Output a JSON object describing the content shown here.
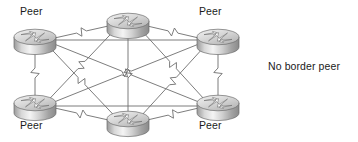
{
  "diagram": {
    "background_color": "#ffffff",
    "link_color": "#6e6e6e",
    "label_color": "#1b1b1b",
    "icon": {
      "name": "cisco-router-icon",
      "body_light": "#f2f2f2",
      "body_mid": "#c9c9c9",
      "body_dark": "#8e8e8e",
      "top_light": "#ececec",
      "top_dark": "#b5b5b5",
      "outline": "#6b6b6b",
      "arrow_color": "#ffffff",
      "arrow_outline": "#7a7a7a"
    },
    "nodes": [
      {
        "id": "r1",
        "label": "Peer",
        "cx": 35,
        "cy": 40,
        "label_x": 20,
        "label_y": 5,
        "has_label": true
      },
      {
        "id": "r2",
        "label": "",
        "cx": 128,
        "cy": 24,
        "label_x": 0,
        "label_y": 0,
        "has_label": false
      },
      {
        "id": "r3",
        "label": "Peer",
        "cx": 218,
        "cy": 40,
        "label_x": 199,
        "label_y": 5,
        "has_label": true
      },
      {
        "id": "r4",
        "label": "Peer",
        "cx": 35,
        "cy": 106,
        "label_x": 20,
        "label_y": 119,
        "has_label": true
      },
      {
        "id": "r5",
        "label": "",
        "cx": 128,
        "cy": 122,
        "label_x": 0,
        "label_y": 0,
        "has_label": false
      },
      {
        "id": "r6",
        "label": "Peer",
        "cx": 218,
        "cy": 106,
        "label_x": 199,
        "label_y": 119,
        "has_label": true
      }
    ],
    "links": [
      {
        "from": "r1",
        "to": "r2",
        "zigzag": true
      },
      {
        "from": "r1",
        "to": "r3",
        "zigzag": false
      },
      {
        "from": "r1",
        "to": "r4",
        "zigzag": true
      },
      {
        "from": "r1",
        "to": "r5",
        "zigzag": true
      },
      {
        "from": "r1",
        "to": "r6",
        "zigzag": true
      },
      {
        "from": "r2",
        "to": "r3",
        "zigzag": true
      },
      {
        "from": "r2",
        "to": "r4",
        "zigzag": true
      },
      {
        "from": "r2",
        "to": "r5",
        "zigzag": true
      },
      {
        "from": "r2",
        "to": "r6",
        "zigzag": true
      },
      {
        "from": "r3",
        "to": "r4",
        "zigzag": true
      },
      {
        "from": "r3",
        "to": "r5",
        "zigzag": true
      },
      {
        "from": "r3",
        "to": "r6",
        "zigzag": true
      },
      {
        "from": "r4",
        "to": "r5",
        "zigzag": true
      },
      {
        "from": "r4",
        "to": "r6",
        "zigzag": false
      },
      {
        "from": "r5",
        "to": "r6",
        "zigzag": true
      }
    ],
    "annotations": [
      {
        "id": "no-border-peer",
        "text": "No border peer",
        "x": 268,
        "y": 60
      }
    ]
  }
}
